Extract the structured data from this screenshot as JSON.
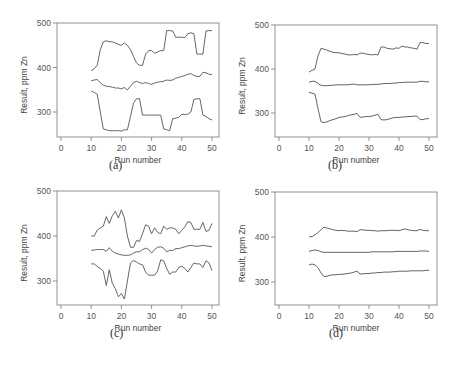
{
  "figure": {
    "panels": [
      {
        "id": "a",
        "caption": "(a)"
      },
      {
        "id": "b",
        "caption": "(b)"
      },
      {
        "id": "c",
        "caption": "(c)"
      },
      {
        "id": "d",
        "caption": "(d)"
      }
    ]
  },
  "chart_data": [
    {
      "type": "line",
      "caption": "(a)",
      "title": "",
      "xlabel": "Run number",
      "ylabel": "Result, ppm Zn",
      "xlim": [
        0,
        50
      ],
      "ylim": [
        245,
        500
      ],
      "xticks": [
        0,
        10,
        20,
        30,
        40,
        50
      ],
      "yticks": [
        300,
        400,
        500
      ],
      "grid": false,
      "legend": "none",
      "x": [
        10,
        11,
        12,
        13,
        14,
        15,
        16,
        17,
        18,
        19,
        20,
        21,
        22,
        23,
        24,
        25,
        26,
        27,
        28,
        29,
        30,
        31,
        32,
        33,
        34,
        35,
        36,
        37,
        38,
        39,
        40,
        41,
        42,
        43,
        44,
        45,
        46,
        47,
        48,
        49,
        50
      ],
      "series": [
        {
          "name": "upper limit",
          "values": [
            393,
            397,
            405,
            440,
            458,
            460,
            458,
            458,
            455,
            452,
            450,
            455,
            450,
            440,
            425,
            410,
            405,
            405,
            430,
            438,
            438,
            432,
            435,
            438,
            438,
            483,
            483,
            482,
            468,
            468,
            468,
            467,
            476,
            478,
            476,
            430,
            430,
            430,
            482,
            483,
            483
          ]
        },
        {
          "name": "mean",
          "values": [
            370,
            372,
            373,
            366,
            360,
            358,
            357,
            356,
            354,
            354,
            352,
            355,
            350,
            358,
            366,
            369,
            366,
            364,
            366,
            364,
            362,
            365,
            367,
            368,
            369,
            372,
            371,
            372,
            376,
            378,
            380,
            382,
            385,
            386,
            382,
            380,
            380,
            389,
            388,
            385,
            384
          ]
        },
        {
          "name": "lower limit",
          "values": [
            347,
            344,
            340,
            300,
            262,
            260,
            258,
            258,
            258,
            258,
            257,
            260,
            260,
            290,
            320,
            330,
            330,
            293,
            293,
            293,
            293,
            293,
            293,
            293,
            262,
            260,
            258,
            285,
            286,
            288,
            295,
            294,
            295,
            300,
            328,
            330,
            330,
            293,
            290,
            285,
            282
          ]
        }
      ]
    },
    {
      "type": "line",
      "caption": "(b)",
      "title": "",
      "xlabel": "Run number",
      "ylabel": "Result, ppm Zn",
      "xlim": [
        0,
        50
      ],
      "ylim": [
        245,
        500
      ],
      "xticks": [
        0,
        10,
        20,
        30,
        40,
        50
      ],
      "yticks": [
        300,
        400,
        500
      ],
      "grid": false,
      "legend": "none",
      "x": [
        10,
        11,
        12,
        13,
        14,
        15,
        16,
        17,
        18,
        19,
        20,
        21,
        22,
        23,
        24,
        25,
        26,
        27,
        28,
        29,
        30,
        31,
        32,
        33,
        34,
        35,
        36,
        37,
        38,
        39,
        40,
        41,
        42,
        43,
        44,
        45,
        46,
        47,
        48,
        49,
        50
      ],
      "series": [
        {
          "name": "upper limit",
          "values": [
            393,
            397,
            400,
            430,
            447,
            445,
            443,
            440,
            438,
            437,
            437,
            435,
            434,
            432,
            432,
            433,
            432,
            436,
            436,
            434,
            433,
            432,
            433,
            432,
            450,
            450,
            447,
            446,
            445,
            448,
            447,
            452,
            450,
            450,
            448,
            447,
            445,
            460,
            460,
            458,
            458
          ]
        },
        {
          "name": "mean",
          "values": [
            370,
            372,
            372,
            367,
            363,
            362,
            362,
            363,
            363,
            364,
            364,
            364,
            364,
            364,
            365,
            366,
            364,
            364,
            364,
            364,
            364,
            365,
            365,
            365,
            366,
            367,
            367,
            367,
            368,
            368,
            369,
            369,
            370,
            370,
            370,
            370,
            370,
            372,
            372,
            371,
            371
          ]
        },
        {
          "name": "lower limit",
          "values": [
            347,
            345,
            343,
            310,
            280,
            278,
            280,
            283,
            285,
            287,
            290,
            291,
            292,
            294,
            296,
            297,
            299,
            290,
            291,
            292,
            292,
            293,
            295,
            297,
            285,
            284,
            285,
            287,
            289,
            290,
            290,
            291,
            291,
            292,
            292,
            293,
            293,
            285,
            285,
            287,
            287
          ]
        }
      ]
    },
    {
      "type": "line",
      "caption": "(c)",
      "title": "",
      "xlabel": "Run number",
      "ylabel": "Result, ppm Zn",
      "xlim": [
        0,
        50
      ],
      "ylim": [
        245,
        500
      ],
      "xticks": [
        0,
        10,
        20,
        30,
        40,
        50
      ],
      "yticks": [
        300,
        400,
        500
      ],
      "grid": false,
      "legend": "none",
      "x": [
        10,
        11,
        12,
        13,
        14,
        15,
        16,
        17,
        18,
        19,
        20,
        21,
        22,
        23,
        24,
        25,
        26,
        27,
        28,
        29,
        30,
        31,
        32,
        33,
        34,
        35,
        36,
        37,
        38,
        39,
        40,
        41,
        42,
        43,
        44,
        45,
        46,
        47,
        48,
        49,
        50
      ],
      "series": [
        {
          "name": "upper limit",
          "values": [
            400,
            400,
            413,
            418,
            422,
            443,
            428,
            445,
            455,
            440,
            458,
            440,
            400,
            375,
            375,
            390,
            388,
            405,
            425,
            422,
            405,
            418,
            408,
            405,
            422,
            415,
            418,
            418,
            415,
            405,
            413,
            420,
            432,
            430,
            415,
            415,
            415,
            430,
            410,
            413,
            428
          ]
        },
        {
          "name": "mean",
          "values": [
            368,
            369,
            370,
            370,
            370,
            366,
            374,
            366,
            362,
            360,
            358,
            357,
            357,
            358,
            362,
            365,
            365,
            370,
            373,
            370,
            362,
            370,
            375,
            376,
            373,
            365,
            368,
            368,
            372,
            372,
            374,
            376,
            378,
            379,
            378,
            377,
            378,
            379,
            378,
            377,
            376
          ]
        },
        {
          "name": "lower limit",
          "values": [
            338,
            338,
            332,
            328,
            322,
            290,
            325,
            295,
            283,
            265,
            272,
            260,
            300,
            340,
            346,
            342,
            338,
            336,
            320,
            313,
            313,
            313,
            322,
            347,
            345,
            328,
            315,
            320,
            320,
            330,
            333,
            328,
            320,
            330,
            340,
            338,
            338,
            330,
            345,
            340,
            323
          ]
        }
      ]
    },
    {
      "type": "line",
      "caption": "(d)",
      "title": "",
      "xlabel": "Run number",
      "ylabel": "Result, ppm Zn",
      "xlim": [
        0,
        50
      ],
      "ylim": [
        245,
        500
      ],
      "xticks": [
        0,
        10,
        20,
        30,
        40,
        50
      ],
      "yticks": [
        300,
        400,
        500
      ],
      "grid": false,
      "legend": "none",
      "x": [
        10,
        11,
        12,
        13,
        14,
        15,
        16,
        17,
        18,
        19,
        20,
        21,
        22,
        23,
        24,
        25,
        26,
        27,
        28,
        29,
        30,
        31,
        32,
        33,
        34,
        35,
        36,
        37,
        38,
        39,
        40,
        41,
        42,
        43,
        44,
        45,
        46,
        47,
        48,
        49,
        50
      ],
      "series": [
        {
          "name": "upper limit",
          "values": [
            400,
            401,
            405,
            410,
            416,
            422,
            420,
            418,
            416,
            415,
            414,
            415,
            414,
            413,
            413,
            413,
            412,
            416,
            416,
            415,
            415,
            414,
            414,
            413,
            414,
            414,
            414,
            415,
            415,
            415,
            414,
            416,
            418,
            416,
            415,
            414,
            414,
            417,
            415,
            414,
            414
          ]
        },
        {
          "name": "mean",
          "values": [
            368,
            370,
            371,
            370,
            367,
            366,
            366,
            366,
            366,
            366,
            366,
            366,
            366,
            366,
            366,
            366,
            366,
            366,
            366,
            366,
            366,
            367,
            367,
            367,
            367,
            367,
            367,
            367,
            367,
            368,
            368,
            368,
            368,
            368,
            368,
            368,
            368,
            369,
            369,
            369,
            368
          ]
        },
        {
          "name": "lower limit",
          "values": [
            338,
            340,
            338,
            332,
            320,
            312,
            313,
            315,
            316,
            316,
            317,
            317,
            318,
            319,
            320,
            322,
            324,
            318,
            318,
            319,
            319,
            320,
            320,
            321,
            321,
            322,
            322,
            322,
            323,
            323,
            324,
            324,
            324,
            324,
            325,
            325,
            325,
            325,
            325,
            326,
            326
          ]
        }
      ]
    }
  ]
}
